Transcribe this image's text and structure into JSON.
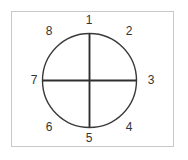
{
  "figure": {
    "background_color": "#ffffff",
    "frame": {
      "border_color": "#c9c9c9",
      "border_width_px": 1,
      "fill_color": "#ffffff"
    },
    "circle": {
      "center_x": 89.5,
      "center_y": 80.5,
      "radius": 47,
      "stroke_color": "#3a3a3a",
      "stroke_width_px": 1.4,
      "fill": "none"
    },
    "axes": {
      "stroke_color": "#2f2f2f",
      "stroke_width_px": 1.9,
      "vertical": {
        "x": 89.5,
        "y1": 33.5,
        "y2": 127.5
      },
      "horizontal": {
        "y": 80.5,
        "x1": 42.5,
        "x2": 136.5
      }
    },
    "label_style": {
      "color": "#333333",
      "font_size_px": 12
    },
    "labels": [
      {
        "id": "label-1",
        "text": "1",
        "position": "top"
      },
      {
        "id": "label-2",
        "text": "2",
        "position": "upper-right"
      },
      {
        "id": "label-3",
        "text": "3",
        "position": "right"
      },
      {
        "id": "label-4",
        "text": "4",
        "position": "lower-right"
      },
      {
        "id": "label-5",
        "text": "5",
        "position": "bottom"
      },
      {
        "id": "label-6",
        "text": "6",
        "position": "lower-left"
      },
      {
        "id": "label-7",
        "text": "7",
        "position": "left"
      },
      {
        "id": "label-8",
        "text": "8",
        "position": "upper-left"
      }
    ]
  }
}
